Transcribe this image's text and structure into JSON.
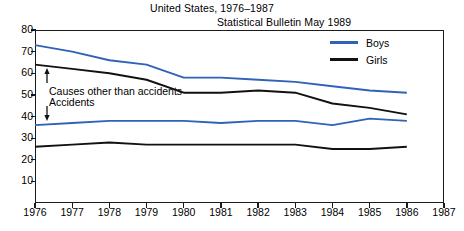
{
  "header": {
    "title": "United States, 1976–1987",
    "source": "Statistical Bulletin May 1989"
  },
  "legend": {
    "position": "top-right",
    "items": [
      {
        "label": "Boys",
        "color": "#2f62b8"
      },
      {
        "label": "Girls",
        "color": "#111111"
      }
    ]
  },
  "annotations": [
    {
      "name": "causes-other-than-accidents",
      "text": "Causes other than accidents"
    },
    {
      "name": "accidents",
      "text": "Accidents"
    }
  ],
  "axes": {
    "y_ticks": [
      "10",
      "20",
      "30",
      "40",
      "50",
      "60",
      "70",
      "80"
    ],
    "x_ticks": [
      "1976",
      "1977",
      "1978",
      "1979",
      "1980",
      "1981",
      "1982",
      "1983",
      "1984",
      "1985",
      "1986",
      "1987"
    ]
  },
  "chart_data": {
    "type": "line",
    "title": "United States, 1976–1987",
    "subtitle": "Statistical Bulletin May 1989",
    "xlabel": "",
    "ylabel": "",
    "xlim": [
      1976,
      1987
    ],
    "ylim": [
      0,
      80
    ],
    "grid": false,
    "legend_position": "top-right",
    "x": [
      1976,
      1977,
      1978,
      1979,
      1980,
      1981,
      1982,
      1983,
      1984,
      1985,
      1986
    ],
    "series": [
      {
        "name": "Boys — Causes other than accidents",
        "color": "#2f62b8",
        "values": [
          73,
          70,
          66,
          64,
          58,
          58,
          57,
          56,
          54,
          52,
          51
        ]
      },
      {
        "name": "Girls — Causes other than accidents",
        "color": "#111111",
        "values": [
          64,
          62,
          60,
          57,
          51,
          51,
          52,
          51,
          46,
          44,
          41
        ]
      },
      {
        "name": "Boys — Accidents",
        "color": "#2f62b8",
        "values": [
          36,
          37,
          38,
          38,
          38,
          37,
          38,
          38,
          36,
          39,
          38
        ]
      },
      {
        "name": "Girls — Accidents",
        "color": "#111111",
        "values": [
          26,
          27,
          28,
          27,
          27,
          27,
          27,
          27,
          25,
          25,
          26
        ]
      }
    ]
  }
}
